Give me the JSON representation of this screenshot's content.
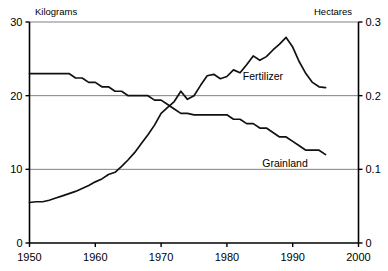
{
  "chart_data": {
    "type": "line",
    "title": "",
    "xlabel": "",
    "ylabel": "Kilograms",
    "y2label": "Hectares",
    "xlim": [
      1950,
      2000
    ],
    "ylim": [
      0,
      30
    ],
    "y2lim": [
      0,
      0.3
    ],
    "grid": true,
    "legend_position": "inline-annotation",
    "x_ticks": [
      "1950",
      "1960",
      "1970",
      "1980",
      "1990",
      "2000"
    ],
    "x_tick_values": [
      1950,
      1960,
      1970,
      1980,
      1990,
      2000
    ],
    "y_ticks": [
      "0",
      "10",
      "20",
      "30"
    ],
    "y_tick_values": [
      0,
      10,
      20,
      30
    ],
    "y2_ticks": [
      "0",
      "0.1",
      "0.2",
      "0.3"
    ],
    "y2_tick_values": [
      0,
      0.1,
      0.2,
      0.3
    ],
    "series": [
      {
        "name": "Fertilizer",
        "axis": "left",
        "unit": "Kilograms",
        "annotation": "Fertilizer",
        "x": [
          1950,
          1951,
          1952,
          1953,
          1954,
          1955,
          1956,
          1957,
          1958,
          1959,
          1960,
          1961,
          1962,
          1963,
          1964,
          1965,
          1966,
          1967,
          1968,
          1969,
          1970,
          1971,
          1972,
          1973,
          1974,
          1975,
          1976,
          1977,
          1978,
          1979,
          1980,
          1981,
          1982,
          1983,
          1984,
          1985,
          1986,
          1987,
          1988,
          1989,
          1990,
          1991,
          1992,
          1993,
          1994,
          1995
        ],
        "values": [
          5.5,
          5.6,
          5.6,
          5.8,
          6.1,
          6.4,
          6.7,
          7.0,
          7.4,
          7.8,
          8.3,
          8.7,
          9.3,
          9.6,
          10.4,
          11.3,
          12.3,
          13.5,
          14.7,
          16.0,
          17.6,
          18.4,
          19.2,
          20.6,
          19.5,
          20.0,
          21.4,
          22.7,
          22.9,
          22.3,
          22.6,
          23.5,
          23.1,
          24.2,
          25.4,
          24.8,
          25.3,
          26.2,
          27.0,
          27.9,
          26.6,
          24.6,
          23.0,
          21.8,
          21.2,
          21.1
        ]
      },
      {
        "name": "Grainland",
        "axis": "right",
        "unit": "Hectares",
        "annotation": "Grainland",
        "x": [
          1950,
          1951,
          1952,
          1953,
          1954,
          1955,
          1956,
          1957,
          1958,
          1959,
          1960,
          1961,
          1962,
          1963,
          1964,
          1965,
          1966,
          1967,
          1968,
          1969,
          1970,
          1971,
          1972,
          1973,
          1974,
          1975,
          1976,
          1977,
          1978,
          1979,
          1980,
          1981,
          1982,
          1983,
          1984,
          1985,
          1986,
          1987,
          1988,
          1989,
          1990,
          1991,
          1992,
          1993,
          1994,
          1995
        ],
        "values": [
          0.23,
          0.23,
          0.23,
          0.23,
          0.23,
          0.23,
          0.23,
          0.224,
          0.224,
          0.218,
          0.218,
          0.212,
          0.212,
          0.206,
          0.206,
          0.2,
          0.2,
          0.2,
          0.2,
          0.194,
          0.194,
          0.188,
          0.182,
          0.176,
          0.176,
          0.174,
          0.174,
          0.174,
          0.174,
          0.174,
          0.174,
          0.168,
          0.168,
          0.162,
          0.162,
          0.156,
          0.156,
          0.15,
          0.144,
          0.144,
          0.138,
          0.132,
          0.126,
          0.126,
          0.126,
          0.12
        ]
      }
    ]
  },
  "axes": {
    "left_unit": "Kilograms",
    "right_unit": "Hectares",
    "left_ticks": [
      "30",
      "20",
      "10",
      "0"
    ],
    "right_ticks": [
      "0.3",
      "0.2",
      "0.1",
      "0"
    ],
    "x_ticks": [
      "1950",
      "1960",
      "1970",
      "1980",
      "1990",
      "2000"
    ]
  },
  "annotations": {
    "fertilizer": "Fertilizer",
    "grainland": "Grainland"
  },
  "colors": {
    "line": "#111111",
    "grid": "#808080",
    "axis": "#000000",
    "background": "#ffffff"
  }
}
